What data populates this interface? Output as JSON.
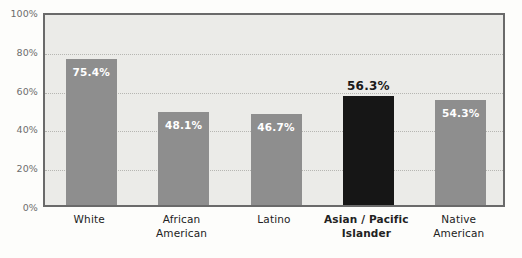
{
  "chart_data": {
    "type": "bar",
    "title": "",
    "xlabel": "",
    "ylabel": "",
    "ylim": [
      0,
      100
    ],
    "grid": true,
    "legend": "none",
    "categories": [
      "White",
      "African American",
      "Latino",
      "Asian / Pacific Islander",
      "Native American"
    ],
    "values": [
      75.4,
      48.1,
      46.7,
      56.3,
      54.3
    ],
    "value_labels": [
      "75.4%",
      "48.1%",
      "46.7%",
      "56.3%",
      "54.3%"
    ],
    "ytick_labels": [
      "0%",
      "20%",
      "40%",
      "60%",
      "80%",
      "100%"
    ],
    "ytick_values": [
      0,
      20,
      40,
      60,
      80,
      100
    ],
    "highlight_index": 3,
    "colors": {
      "bar": "#8e8e8e",
      "bar_highlight": "#161616",
      "plot_background": "#ebebe8",
      "page_background": "#fdfdfb",
      "frame_border": "#6a6a6a",
      "gridline": "#b6b6b2",
      "value_label_inside": "#ffffff",
      "value_label_above": "#1a1a1a",
      "tick_label": "#6d6d6d",
      "category_label": "#222222"
    },
    "bars": [
      {
        "category": "White",
        "category_lines": [
          "White"
        ],
        "value": 75.4,
        "label": "75.4%",
        "label_position": "inside",
        "highlighted": false
      },
      {
        "category": "African American",
        "category_lines": [
          "African",
          "American"
        ],
        "value": 48.1,
        "label": "48.1%",
        "label_position": "inside",
        "highlighted": false
      },
      {
        "category": "Latino",
        "category_lines": [
          "Latino"
        ],
        "value": 46.7,
        "label": "46.7%",
        "label_position": "inside",
        "highlighted": false
      },
      {
        "category": "Asian / Pacific Islander",
        "category_lines": [
          "Asian / Pacific",
          "Islander"
        ],
        "value": 56.3,
        "label": "56.3%",
        "label_position": "above",
        "highlighted": true
      },
      {
        "category": "Native American",
        "category_lines": [
          "Native",
          "American"
        ],
        "value": 54.3,
        "label": "54.3%",
        "label_position": "inside",
        "highlighted": false
      }
    ]
  }
}
